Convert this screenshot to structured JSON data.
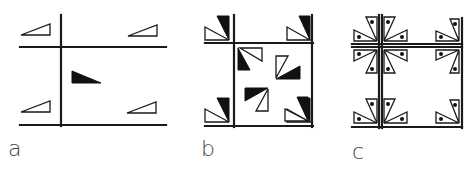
{
  "figure": {
    "panels": [
      {
        "id": "a",
        "label": "a",
        "description": "Rectangular lattice with open asymmetric triangles at lattice corners and one filled triangle in the cell center"
      },
      {
        "id": "b",
        "label": "b",
        "description": "Square lattice with paired open/filled triangle motifs at corners and rotated pairs inside the cell"
      },
      {
        "id": "c",
        "label": "c",
        "description": "Square lattice with four-fold pinwheel clusters of open triangles each containing a dot"
      }
    ],
    "colors": {
      "line": "#1a1a1a",
      "filled_motif": "#111111",
      "background": "#ffffff",
      "label": "#444444"
    }
  }
}
